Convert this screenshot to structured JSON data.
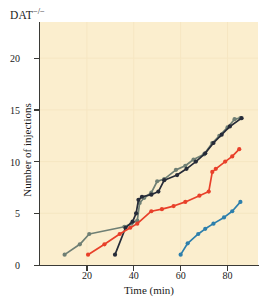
{
  "panel": {
    "title_main": "DAT",
    "title_sup": "−/−"
  },
  "chart_data": {
    "type": "line",
    "title": "DAT−/−",
    "xlabel": "Time (min)",
    "ylabel": "Number of injections",
    "xlim": [
      0,
      93
    ],
    "ylim": [
      0,
      23.5
    ],
    "xticks": [
      20,
      40,
      60,
      80
    ],
    "yticks": [
      0,
      5,
      10,
      15,
      20
    ],
    "grid": "faint",
    "legend": "none",
    "background_color": "#fbeece",
    "markers": "filled circles",
    "series": [
      {
        "name": "subject-gray-green",
        "color": "#6f7f74",
        "points": [
          [
            10.5,
            1.0
          ],
          [
            17.0,
            2.0
          ],
          [
            21.0,
            3.0
          ],
          [
            36.0,
            3.7
          ],
          [
            39.0,
            4.0
          ],
          [
            41.5,
            4.3
          ],
          [
            42.5,
            6.0
          ],
          [
            44.5,
            6.5
          ],
          [
            47.5,
            7.0
          ],
          [
            50.0,
            8.1
          ],
          [
            53.0,
            8.3
          ],
          [
            58.0,
            9.2
          ],
          [
            62.0,
            9.6
          ],
          [
            65.5,
            10.2
          ],
          [
            70.0,
            10.7
          ],
          [
            73.5,
            11.8
          ],
          [
            76.5,
            12.5
          ],
          [
            80.0,
            13.3
          ],
          [
            83.0,
            14.1
          ],
          [
            85.5,
            14.2
          ]
        ]
      },
      {
        "name": "subject-dark-navy",
        "color": "#262b38",
        "points": [
          [
            32.0,
            1.0
          ],
          [
            36.5,
            3.6
          ],
          [
            39.5,
            4.2
          ],
          [
            41.0,
            5.0
          ],
          [
            42.0,
            6.3
          ],
          [
            43.5,
            6.6
          ],
          [
            47.5,
            6.8
          ],
          [
            50.5,
            7.1
          ],
          [
            53.0,
            8.2
          ],
          [
            58.5,
            8.7
          ],
          [
            62.5,
            9.3
          ],
          [
            66.5,
            10.0
          ],
          [
            70.5,
            10.8
          ],
          [
            74.0,
            11.8
          ],
          [
            77.5,
            12.6
          ],
          [
            81.0,
            13.4
          ],
          [
            86.0,
            14.2
          ]
        ]
      },
      {
        "name": "subject-red",
        "color": "#e8402a",
        "points": [
          [
            20.5,
            1.0
          ],
          [
            27.5,
            2.0
          ],
          [
            34.0,
            3.0
          ],
          [
            38.5,
            3.6
          ],
          [
            41.5,
            4.0
          ],
          [
            47.5,
            5.2
          ],
          [
            52.0,
            5.4
          ],
          [
            57.0,
            5.7
          ],
          [
            62.0,
            6.1
          ],
          [
            68.0,
            6.7
          ],
          [
            72.0,
            7.1
          ],
          [
            73.5,
            9.0
          ],
          [
            75.0,
            9.3
          ],
          [
            79.0,
            10.0
          ],
          [
            82.0,
            10.5
          ],
          [
            85.0,
            11.2
          ]
        ]
      },
      {
        "name": "subject-blue",
        "color": "#2d7fac",
        "points": [
          [
            60.0,
            1.0
          ],
          [
            63.0,
            2.1
          ],
          [
            67.5,
            3.0
          ],
          [
            70.5,
            3.5
          ],
          [
            74.0,
            4.0
          ],
          [
            78.5,
            4.6
          ],
          [
            82.0,
            5.2
          ],
          [
            85.5,
            6.1
          ]
        ]
      }
    ]
  },
  "axes": {
    "x_ticks": [
      "20",
      "40",
      "60",
      "80"
    ],
    "y_ticks": [
      "0",
      "5",
      "10",
      "15",
      "20"
    ],
    "x_title": "Time (min)",
    "y_title": "Number of injections"
  }
}
